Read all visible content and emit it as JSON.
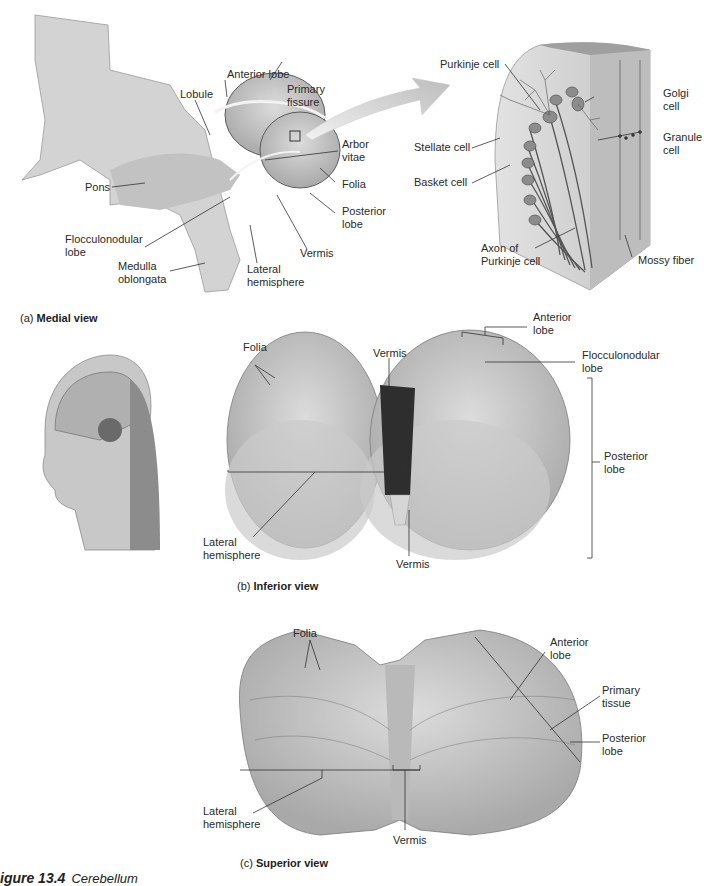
{
  "figure": {
    "caption_number": "igure 13.4",
    "caption_title": "Cerebellum"
  },
  "panel_a": {
    "caption_letter": "(a)",
    "caption_title": "Medial view",
    "labels": {
      "anterior_lobe": "Anterior lobe",
      "lobule": "Lobule",
      "primary_fissure": "Primary\nfissure",
      "arbor_vitae": "Arbor\nvitae",
      "folia": "Folia",
      "posterior_lobe": "Posterior\nlobe",
      "vermis": "Vermis",
      "lateral_hemisphere": "Lateral\nhemisphere",
      "pons": "Pons",
      "flocculonodular_lobe": "Flocculonodular\nlobe",
      "medulla_oblongata": "Medulla\noblongata"
    },
    "inset_labels": {
      "purkinje_cell": "Purkinje cell",
      "golgi_cell": "Golgi\ncell",
      "granule_cell": "Granule\ncell",
      "stellate_cell": "Stellate cell",
      "basket_cell": "Basket cell",
      "axon_of_purkinje_cell": "Axon of\nPurkinje cell",
      "mossy_fiber": "Mossy fiber"
    }
  },
  "panel_b": {
    "caption_letter": "(b)",
    "caption_title": "Inferior view",
    "labels": {
      "folia": "Folia",
      "vermis_top": "Vermis",
      "anterior_lobe": "Anterior\nlobe",
      "flocculonodular_lobe": "Flocculonodular\nlobe",
      "posterior_lobe": "Posterior\nlobe",
      "lateral_hemisphere": "Lateral\nhemisphere",
      "vermis_bottom": "Vermis"
    }
  },
  "panel_c": {
    "caption_letter": "(c)",
    "caption_title": "Superior view",
    "labels": {
      "folia": "Folia",
      "anterior_lobe": "Anterior\nlobe",
      "primary_tissue": "Primary\ntissue",
      "posterior_lobe": "Posterior\nlobe",
      "lateral_hemisphere": "Lateral\nhemisphere",
      "vermis": "Vermis"
    }
  },
  "colors": {
    "tissue": "#c9c9c9",
    "tissue_dark": "#8a8a8a",
    "line": "#333333",
    "arrow": "#d4d4d4"
  }
}
